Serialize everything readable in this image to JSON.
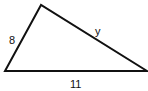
{
  "diagram": {
    "type": "triangle",
    "vertices": {
      "top": [
        41,
        5
      ],
      "bottom_left": [
        5,
        71
      ],
      "bottom_right": [
        147,
        71
      ]
    },
    "sides": {
      "left": "8",
      "hypotenuse": "y",
      "base": "11"
    },
    "stroke_color": "#111111"
  }
}
